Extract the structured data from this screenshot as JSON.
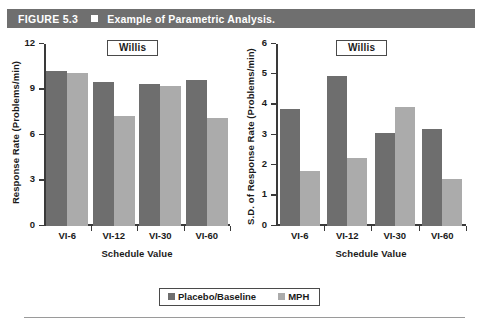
{
  "figure": {
    "number": "FIGURE 5.3",
    "bullet_icon": "square-bullet-icon",
    "title": "Example of Parametric Analysis.",
    "bar_color": "#6f6f6f",
    "text_color": "#ffffff"
  },
  "legend": {
    "entries": [
      {
        "label": "Placebo/Baseline",
        "color": "#6e6e6e"
      },
      {
        "label": "MPH",
        "color": "#ababab"
      }
    ]
  },
  "chart_data": [
    {
      "type": "bar",
      "title": "Willis",
      "panel": "left",
      "xlabel": "Schedule Value",
      "ylabel": "Response Rate (Problems/min)",
      "categories": [
        "VI-6",
        "VI-12",
        "VI-30",
        "VI-60"
      ],
      "series": [
        {
          "name": "Placebo/Baseline",
          "color": "#6e6e6e",
          "values": [
            10.2,
            9.5,
            9.35,
            9.6
          ]
        },
        {
          "name": "MPH",
          "color": "#ababab",
          "values": [
            10.1,
            7.25,
            9.2,
            7.1
          ]
        }
      ],
      "ylim": [
        0,
        12
      ],
      "yticks": [
        0,
        3,
        6,
        9,
        12
      ],
      "grid": false,
      "legend_position": "bottom-center"
    },
    {
      "type": "bar",
      "title": "Willis",
      "panel": "right",
      "xlabel": "Schedule Value",
      "ylabel": "S.D. of Response Rate (Problems/min)",
      "categories": [
        "VI-6",
        "VI-12",
        "VI-30",
        "VI-60"
      ],
      "series": [
        {
          "name": "Placebo/Baseline",
          "color": "#6e6e6e",
          "values": [
            3.87,
            4.93,
            3.06,
            3.19
          ]
        },
        {
          "name": "MPH",
          "color": "#ababab",
          "values": [
            1.83,
            2.23,
            3.92,
            1.56
          ]
        }
      ],
      "ylim": [
        0,
        6
      ],
      "yticks": [
        0,
        1,
        2,
        3,
        4,
        5,
        6
      ],
      "grid": false,
      "legend_position": "bottom-center"
    }
  ]
}
